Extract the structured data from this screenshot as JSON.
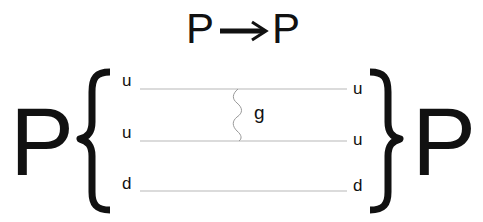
{
  "diagram": {
    "title": {
      "initial": "P",
      "arrow": "→",
      "final": "P"
    },
    "incoming_particle": "P",
    "outgoing_particle": "P",
    "quark_lines": [
      {
        "left_label": "u",
        "right_label": "u"
      },
      {
        "left_label": "u",
        "right_label": "u"
      },
      {
        "left_label": "d",
        "right_label": "d"
      }
    ],
    "gluon": {
      "label": "g",
      "connects": [
        "line 1",
        "line 2"
      ]
    },
    "colors": {
      "text": "#111111",
      "line": "#b8b8b8",
      "background": "#ffffff"
    }
  }
}
